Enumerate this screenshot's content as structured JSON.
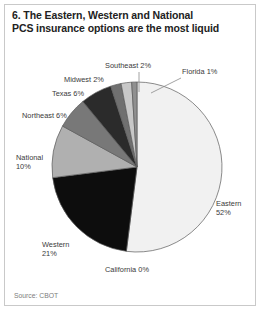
{
  "figure": {
    "title": "6. The Eastern, Western and National PCS insurance options are the most liquid",
    "title_line1": "6. The Eastern, Western and National",
    "title_line2": "PCS insurance options are the most liquid",
    "source": "Source: CBOT",
    "border_color": "#c9c9c9",
    "background": "#ffffff"
  },
  "chart_data": {
    "type": "pie",
    "title": "6. The Eastern, Western and National PCS insurance options are the most liquid",
    "xlabel": "",
    "ylabel": "",
    "units": "percent",
    "legend_position": "callout-labels",
    "grid": false,
    "start_angle_deg": -90,
    "direction": "clockwise",
    "categories": [
      "Eastern",
      "California",
      "Western",
      "National",
      "Northeast",
      "Texas",
      "Midwest",
      "Southeast",
      "Florida"
    ],
    "values": [
      52,
      0,
      21,
      10,
      6,
      6,
      2,
      2,
      1
    ],
    "colors": [
      "#f1f1f1",
      "#f1f1f1",
      "#0d0d0d",
      "#b0b0b0",
      "#787878",
      "#2b2b2b",
      "#707070",
      "#c8c8c8",
      "#909090"
    ],
    "slices": [
      {
        "name": "Eastern",
        "value": 52,
        "label": "Eastern",
        "value_label": "52%",
        "color": "#f1f1f1"
      },
      {
        "name": "California",
        "value": 0,
        "label": "California",
        "value_label": "0%",
        "color": "#f1f1f1"
      },
      {
        "name": "Western",
        "value": 21,
        "label": "Western",
        "value_label": "21%",
        "color": "#0d0d0d"
      },
      {
        "name": "National",
        "value": 10,
        "label": "National",
        "value_label": "10%",
        "color": "#b0b0b0"
      },
      {
        "name": "Northeast",
        "value": 6,
        "label": "Northeast",
        "value_label": "6%",
        "color": "#787878"
      },
      {
        "name": "Texas",
        "value": 6,
        "label": "Texas",
        "value_label": "6%",
        "color": "#2b2b2b"
      },
      {
        "name": "Midwest",
        "value": 2,
        "label": "Midwest",
        "value_label": "2%",
        "color": "#707070"
      },
      {
        "name": "Southeast",
        "value": 2,
        "label": "Southeast",
        "value_label": "2%",
        "color": "#c8c8c8"
      },
      {
        "name": "Florida",
        "value": 1,
        "label": "Florida",
        "value_label": "1%",
        "color": "#909090"
      }
    ]
  },
  "labels": {
    "eastern": "Eastern",
    "eastern_value": "52%",
    "california": "California 0%",
    "western": "Western",
    "western_value": "21%",
    "national": "National",
    "national_value": "10%",
    "northeast": "Northeast 6%",
    "texas": "Texas 6%",
    "midwest": "Midwest 2%",
    "southeast": "Southeast 2%",
    "florida": "Florida 1%"
  }
}
